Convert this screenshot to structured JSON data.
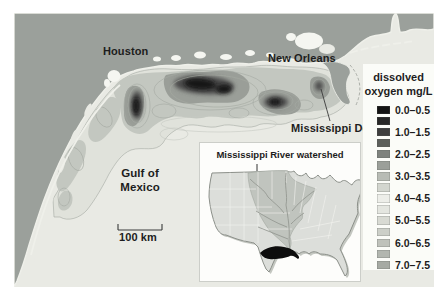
{
  "colors": {
    "land": "#9ba09b",
    "water": "#e9eae4",
    "lake": "#f5f6f1",
    "coast-rim": "#eff0ea",
    "band": "#e0e2db",
    "mid": "#c3c7c0",
    "dark": "#9a9e98",
    "vdark": "#4c4c4c",
    "core": "#161616",
    "ring": "#a5a9a2",
    "inset-bg": "#fdfdfb",
    "inset-land": "#dcdeda",
    "watershed": "#c0c4be",
    "river": "#8f938d",
    "hypoxia": "#0d0d0d",
    "legend-bg": "#fbfcf8",
    "text": "#1d1d1d"
  },
  "map": {
    "labels": {
      "houston": "Houston",
      "new_orleans": "New Orleans",
      "mississippi_delta": "Mississippi Delta",
      "gulf_line1": "Gulf of",
      "gulf_line2": "Mexico",
      "scale_bar": "100 km"
    }
  },
  "inset": {
    "title": "Mississippi River watershed"
  },
  "legend": {
    "title_line1": "dissolved",
    "title_line2": "oxygen mg/L",
    "entries": [
      {
        "color": "#141414",
        "label": "0.0–0.5"
      },
      {
        "color": "#272727",
        "label": ""
      },
      {
        "color": "#3e3e3e",
        "label": "1.0–1.5"
      },
      {
        "color": "#5c5f5b",
        "label": ""
      },
      {
        "color": "#7e827d",
        "label": "2.0–2.5"
      },
      {
        "color": "#9b9f99",
        "label": ""
      },
      {
        "color": "#b8bcb5",
        "label": "3.0–3.5"
      },
      {
        "color": "#d3d6cf",
        "label": ""
      },
      {
        "color": "#edeee9",
        "label": "4.0–4.5"
      },
      {
        "color": "#e4e6e0",
        "label": ""
      },
      {
        "color": "#d8dad3",
        "label": "5.0–5.5"
      },
      {
        "color": "#cccfc8",
        "label": ""
      },
      {
        "color": "#bfc2bb",
        "label": "6.0–6.5"
      },
      {
        "color": "#b2b6af",
        "label": ""
      },
      {
        "color": "#a6aaa3",
        "label": "7.0–7.5"
      }
    ]
  }
}
